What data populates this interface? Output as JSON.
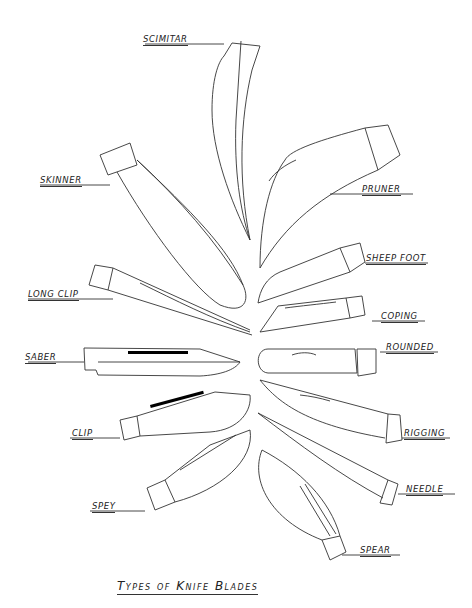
{
  "title": "Types of Knife Blades",
  "labels": {
    "scimitar": "SCIMITAR",
    "skinner": "SKINNER",
    "pruner": "PRUNER",
    "sheep_foot": "SHEEP FOOT",
    "long_clip": "LONG CLIP",
    "coping": "COPING",
    "saber": "SABER",
    "rounded": "ROUNDED",
    "clip": "CLIP",
    "rigging": "RIGGING",
    "spey": "SPEY",
    "needle": "NEEDLE",
    "spear": "SPEAR"
  }
}
